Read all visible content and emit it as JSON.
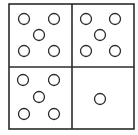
{
  "puzzle": {
    "type": "2x2 grid of dot patterns",
    "colors": {
      "stroke": "#2b2b2b",
      "background": "#ffffff"
    },
    "grid": {
      "left": 9,
      "top": 4,
      "right": 134,
      "bottom": 129,
      "mid_x": 72,
      "mid_y": 67
    },
    "circle_radius": 5.5,
    "cells": [
      {
        "position": "top-left",
        "count": 5,
        "circles": [
          [
            24,
            19
          ],
          [
            54,
            19
          ],
          [
            39,
            35
          ],
          [
            24,
            51
          ],
          [
            54,
            51
          ]
        ]
      },
      {
        "position": "top-right",
        "count": 5,
        "circles": [
          [
            86,
            19
          ],
          [
            115,
            19
          ],
          [
            100,
            35
          ],
          [
            86,
            51
          ],
          [
            115,
            51
          ]
        ]
      },
      {
        "position": "bottom-left",
        "count": 5,
        "circles": [
          [
            23,
            80
          ],
          [
            54,
            80
          ],
          [
            39,
            97
          ],
          [
            24,
            114
          ],
          [
            54,
            114
          ]
        ]
      },
      {
        "position": "bottom-right",
        "count": 1,
        "circles": [
          [
            100,
            99
          ]
        ]
      }
    ]
  }
}
